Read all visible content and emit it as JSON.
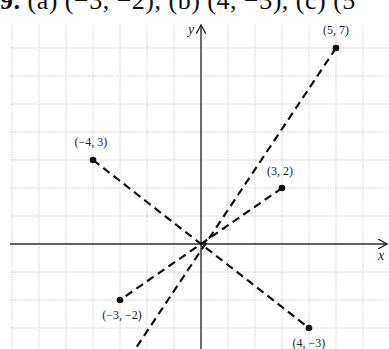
{
  "header": {
    "number": "9.",
    "text": "(a) (−3, −2), (b) (4, −3), (c) (5"
  },
  "chart_data": {
    "type": "scatter",
    "title": "",
    "xlabel": "x",
    "ylabel": "y",
    "grid": true,
    "xlim": [
      -7,
      7
    ],
    "ylim": [
      -4,
      8
    ],
    "points": [
      {
        "x": 5,
        "y": 7,
        "label": "(5, 7)"
      },
      {
        "x": -4,
        "y": 3,
        "label": "(−4, 3)"
      },
      {
        "x": 3,
        "y": 2,
        "label": "(3, 2)"
      },
      {
        "x": -3,
        "y": -2,
        "label": "(−3, −2)"
      },
      {
        "x": 4,
        "y": -3,
        "label": "(4, −3)"
      }
    ],
    "dashed_lines": [
      {
        "from": [
          5,
          7
        ],
        "to": [
          -2.4,
          -3.7
        ],
        "through_origin": true
      },
      {
        "from": [
          3,
          2
        ],
        "to": [
          -3,
          -2
        ],
        "through_origin": true
      },
      {
        "from": [
          -4,
          3
        ],
        "to": [
          4,
          -3
        ],
        "through_origin": true
      }
    ]
  }
}
